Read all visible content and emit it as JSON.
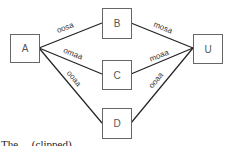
{
  "diagram": {
    "nodes": [
      {
        "id": "A",
        "label": "A",
        "x": 10,
        "y": 34,
        "w": 29,
        "h": 28
      },
      {
        "id": "B",
        "label": "B",
        "x": 102,
        "y": 8,
        "w": 29,
        "h": 30
      },
      {
        "id": "C",
        "label": "C",
        "x": 102,
        "y": 60,
        "w": 29,
        "h": 29
      },
      {
        "id": "D",
        "label": "D",
        "x": 102,
        "y": 108,
        "w": 29,
        "h": 30
      },
      {
        "id": "U",
        "label": "U",
        "x": 193,
        "y": 34,
        "w": 29,
        "h": 29
      }
    ],
    "edges": [
      {
        "from": "A",
        "to": "B",
        "label": "oosa"
      },
      {
        "from": "A",
        "to": "C",
        "label": "omaa"
      },
      {
        "from": "A",
        "to": "D",
        "label": "ooaa"
      },
      {
        "from": "B",
        "to": "U",
        "label": "mosa"
      },
      {
        "from": "C",
        "to": "U",
        "label": "moaa"
      },
      {
        "from": "D",
        "to": "U",
        "label": "ooaa"
      }
    ]
  },
  "caption": {
    "text": "The ... (clipped)"
  }
}
